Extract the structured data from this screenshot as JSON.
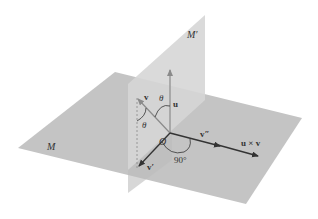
{
  "figure": {
    "type": "3D geometric diagram",
    "planes": [
      {
        "id": "horizontal",
        "label": "M",
        "color": "#c4c4c4"
      },
      {
        "id": "vertical",
        "label": "M′",
        "color": "#d4d4d4"
      }
    ],
    "origin_label": "O",
    "vectors": [
      {
        "id": "u",
        "label": "u",
        "direction": "up",
        "color": "#8a8a8a"
      },
      {
        "id": "v",
        "label": "v",
        "direction": "upper-left",
        "color": "#8a8a8a"
      },
      {
        "id": "v_prime",
        "label": "v′",
        "direction": "lower-left",
        "color": "#333333"
      },
      {
        "id": "v_double_prime",
        "label": "v″",
        "direction": "right",
        "color": "#333333"
      },
      {
        "id": "u_cross_v",
        "label": "u × v",
        "direction": "right",
        "color": "#333333"
      }
    ],
    "angles": [
      {
        "id": "theta_upper",
        "label": "θ",
        "between": [
          "v",
          "u"
        ]
      },
      {
        "id": "theta_lower",
        "label": "θ",
        "between": [
          "v",
          "v′"
        ]
      },
      {
        "id": "right_angle",
        "label": "90°",
        "between": [
          "v′",
          "v″"
        ]
      }
    ]
  }
}
